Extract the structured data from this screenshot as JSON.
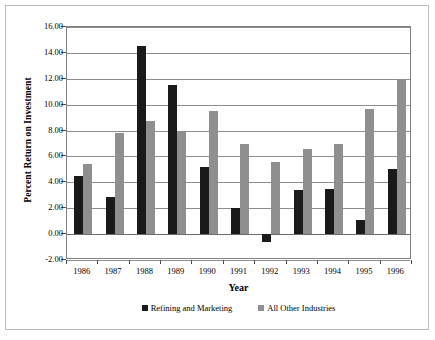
{
  "chart_data": {
    "type": "bar",
    "title": "",
    "xlabel": "Year",
    "ylabel": "Percent Return on Investment",
    "categories": [
      "1986",
      "1987",
      "1988",
      "1989",
      "1990",
      "1991",
      "1992",
      "1993",
      "1994",
      "1995",
      "1996"
    ],
    "series": [
      {
        "name": "Refining and Marketing",
        "color": "#1a1a1a",
        "values": [
          4.5,
          2.9,
          14.5,
          11.5,
          5.2,
          2.0,
          -0.6,
          3.4,
          3.5,
          1.1,
          5.0
        ]
      },
      {
        "name": "All Other Industries",
        "color": "#8f8f8f",
        "values": [
          5.4,
          7.8,
          8.7,
          7.9,
          9.5,
          7.0,
          5.6,
          6.6,
          7.0,
          9.7,
          12.0
        ]
      }
    ],
    "ylim": [
      -2.0,
      16.0
    ],
    "ytick_step": 2.0,
    "ytick_labels": [
      "16.00",
      "14.00",
      "12.00",
      "10.00",
      "8.00",
      "6.00",
      "4.00",
      "2.00",
      "0.00",
      "-2.00"
    ],
    "ytick_values": [
      16,
      14,
      12,
      10,
      8,
      6,
      4,
      2,
      0,
      -2
    ],
    "grid": true,
    "legend_position": "bottom"
  }
}
